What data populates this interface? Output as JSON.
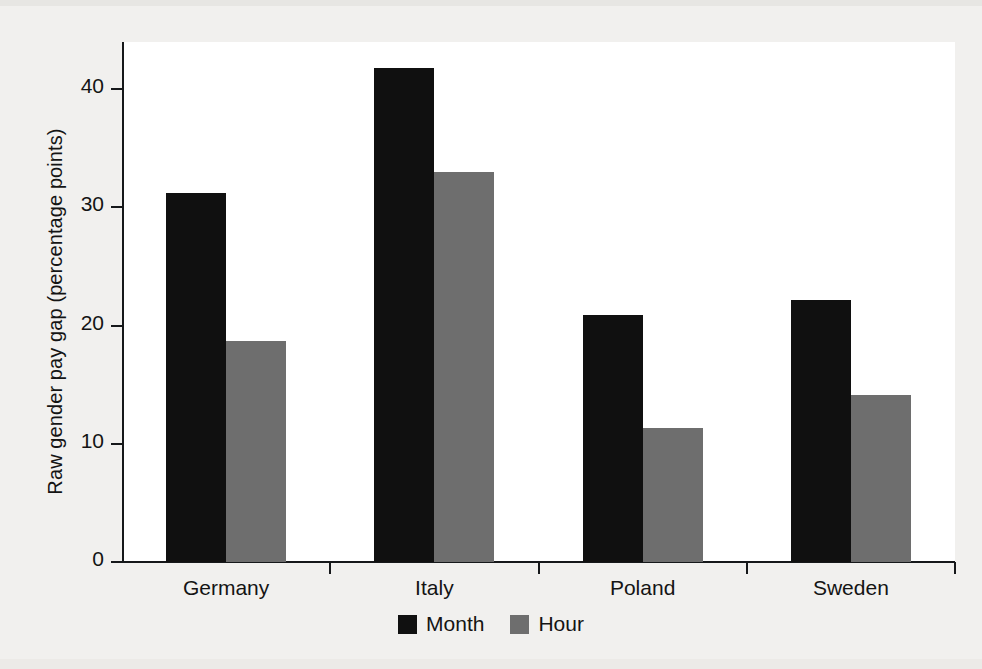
{
  "chart_data": {
    "type": "bar",
    "title": "",
    "subtitle": "",
    "xlabel": "",
    "ylabel": "Raw gender pay gap (percentage points)",
    "categories": [
      "Germany",
      "Italy",
      "Poland",
      "Sweden"
    ],
    "series": [
      {
        "name": "Month",
        "color": "#101010",
        "values": [
          31.2,
          41.8,
          20.9,
          22.2
        ]
      },
      {
        "name": "Hour",
        "color": "#6e6e6e",
        "values": [
          18.7,
          33.0,
          11.3,
          14.1
        ]
      }
    ],
    "ylim": [
      0,
      44
    ],
    "yticks": [
      0,
      10,
      20,
      30,
      40
    ],
    "ytick_labels": [
      "0",
      "10",
      "20",
      "30",
      "40"
    ],
    "grid": false,
    "legend_position": "bottom-center",
    "legend_entries": [
      {
        "label": "Month",
        "color": "#101010"
      },
      {
        "label": "Hour",
        "color": "#6e6e6e"
      }
    ],
    "bar_layout": "grouped-adjacent",
    "axis_color": "#16181a",
    "plot_background": "#ffffff",
    "page_background": "#f1f0ee"
  }
}
